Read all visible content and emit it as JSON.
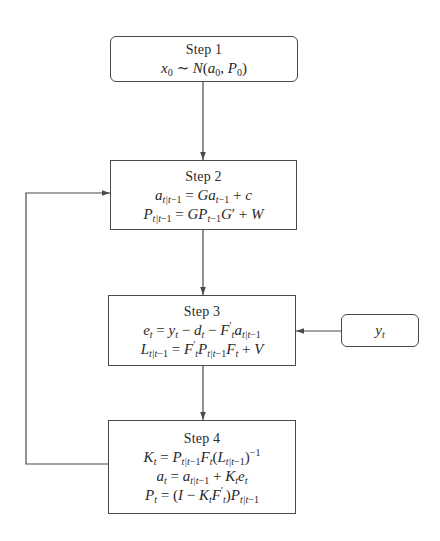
{
  "diagram": {
    "colors": {
      "stroke": "#4a4a4a",
      "text": "#2a2a2a",
      "background": "#ffffff"
    },
    "nodes": [
      {
        "id": "step1",
        "title": "Step 1",
        "shape": "rounded-rect",
        "equations": [
          "x₀ ~ N(a₀, P₀)"
        ]
      },
      {
        "id": "step2",
        "title": "Step 2",
        "shape": "rect",
        "equations": [
          "a_{t|t−1} = G a_{t−1} + c",
          "P_{t|t−1} = G P_{t−1} G′ + W"
        ]
      },
      {
        "id": "step3",
        "title": "Step 3",
        "shape": "rect",
        "equations": [
          "e_t = y_t − d_t − F′_t a_{t|t−1}",
          "L_{t|t−1} = F′_t P_{t|t−1} F_t + V"
        ]
      },
      {
        "id": "step4",
        "title": "Step 4",
        "shape": "rect",
        "equations": [
          "K_t = P_{t|t−1} F_t (L_{t|t−1})^{−1}",
          "a_t = a_{t|t−1} + K_t e_t",
          "P_t = (I − K_t F′_t) P_{t|t−1}"
        ]
      },
      {
        "id": "input",
        "title": "",
        "shape": "rounded-rect",
        "equations": [
          "y_t"
        ]
      }
    ],
    "edges": [
      {
        "from": "step1",
        "to": "step2"
      },
      {
        "from": "step2",
        "to": "step3"
      },
      {
        "from": "step3",
        "to": "step4"
      },
      {
        "from": "input",
        "to": "step3"
      },
      {
        "from": "step4",
        "to": "step2",
        "label": "feedback loop"
      }
    ]
  },
  "labels": {
    "step1_title": "Step 1",
    "step2_title": "Step 2",
    "step3_title": "Step 3",
    "step4_title": "Step 4"
  }
}
